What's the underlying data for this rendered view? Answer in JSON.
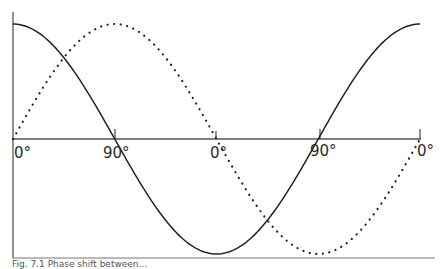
{
  "chart_data": {
    "type": "line",
    "title": "",
    "xlabel": "",
    "ylabel": "",
    "tick_labels": [
      "0°",
      "90°",
      "0°",
      "90°",
      "0°"
    ],
    "series": [
      {
        "name": "solid",
        "style": "solid",
        "function": "cos",
        "description": "Starts at maximum, crosses zero at first 90°, minimum at middle 0°, crosses zero at second 90°, returns to maximum at final 0°",
        "values": [
          1,
          0,
          -1,
          0,
          1
        ]
      },
      {
        "name": "dotted",
        "style": "dotted",
        "function": "sin",
        "description": "Starts at zero, maximum at first 90°, zero at middle 0°, minimum at second 90°, returns to zero at final 0°",
        "values": [
          0,
          1,
          0,
          -1,
          0
        ]
      }
    ],
    "grid": false,
    "legend": null
  },
  "labels": {
    "t0": "0°",
    "t1": "90°",
    "t2": "0°",
    "t3": "90°",
    "t4": "0°"
  },
  "caption": "Fig. 7.1 Phase shift between..."
}
